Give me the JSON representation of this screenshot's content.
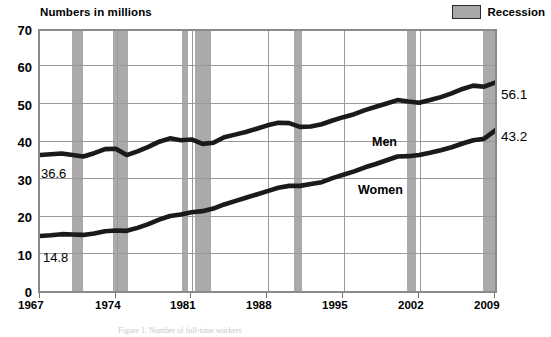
{
  "header": {
    "title": "Numbers in millions",
    "legend": {
      "swatch_name": "recession-swatch",
      "label": "Recession",
      "color": "#a8a8a8"
    }
  },
  "annotations": {
    "men_label": "Men",
    "women_label": "Women",
    "men_start_value": "36.6",
    "women_start_value": "14.8",
    "men_end_value": "56.1",
    "women_end_value": "43.2"
  },
  "caption": "Figure 1. Number of full-time workers",
  "chart_data": {
    "type": "line",
    "title": "Numbers in millions",
    "xlabel": "",
    "ylabel": "Numbers in millions",
    "xlim": [
      1967,
      2009
    ],
    "ylim": [
      0,
      70
    ],
    "yticks": [
      0,
      10,
      20,
      30,
      40,
      50,
      60,
      70
    ],
    "xticks": [
      1967,
      1974,
      1981,
      1988,
      1995,
      2002,
      2009
    ],
    "xtick_labels": [
      "1967",
      "1974",
      "1981",
      "1988",
      "1995",
      "2002",
      "2009"
    ],
    "ytick_labels": [
      "0",
      "10",
      "20",
      "30",
      "40",
      "50",
      "60",
      "70"
    ],
    "grid": true,
    "legend_position": "top-right",
    "x": [
      1967,
      1968,
      1969,
      1970,
      1971,
      1972,
      1973,
      1974,
      1975,
      1976,
      1977,
      1978,
      1979,
      1980,
      1981,
      1982,
      1983,
      1984,
      1985,
      1986,
      1987,
      1988,
      1989,
      1990,
      1991,
      1992,
      1993,
      1994,
      1995,
      1996,
      1997,
      1998,
      1999,
      2000,
      2001,
      2002,
      2003,
      2004,
      2005,
      2006,
      2007,
      2008,
      2009
    ],
    "series": [
      {
        "name": "Men",
        "color": "#1a1a1a",
        "values": [
          36.6,
          36.8,
          37.0,
          36.6,
          36.2,
          37.1,
          38.2,
          38.3,
          36.6,
          37.6,
          38.8,
          40.2,
          41.1,
          40.6,
          40.8,
          39.6,
          39.9,
          41.4,
          42.1,
          42.8,
          43.7,
          44.6,
          45.3,
          45.2,
          44.2,
          44.3,
          44.9,
          45.9,
          46.8,
          47.6,
          48.7,
          49.6,
          50.5,
          51.4,
          51.0,
          50.7,
          51.4,
          52.2,
          53.2,
          54.4,
          55.3,
          55.0,
          56.1
        ]
      },
      {
        "name": "Women",
        "color": "#1a1a1a",
        "values": [
          14.8,
          15.0,
          15.3,
          15.2,
          15.1,
          15.5,
          16.1,
          16.3,
          16.2,
          17.0,
          18.0,
          19.2,
          20.2,
          20.6,
          21.2,
          21.5,
          22.2,
          23.3,
          24.2,
          25.1,
          26.0,
          26.9,
          27.8,
          28.3,
          28.3,
          28.8,
          29.3,
          30.4,
          31.3,
          32.2,
          33.3,
          34.2,
          35.2,
          36.2,
          36.3,
          36.6,
          37.2,
          37.9,
          38.7,
          39.7,
          40.6,
          41.0,
          43.2
        ]
      }
    ],
    "recessions": [
      {
        "label": "1969-1970",
        "start": 1969.9,
        "end": 1970.9
      },
      {
        "label": "1973-1975",
        "start": 1973.7,
        "end": 1975.1
      },
      {
        "label": "1980",
        "start": 1980.0,
        "end": 1980.5
      },
      {
        "label": "1981-1982",
        "start": 1981.2,
        "end": 1982.7
      },
      {
        "label": "1990-1991",
        "start": 1990.3,
        "end": 1991.0
      },
      {
        "label": "2001",
        "start": 2000.6,
        "end": 2001.4
      },
      {
        "label": "2007-2009",
        "start": 2007.5,
        "end": 2009.2
      }
    ]
  }
}
